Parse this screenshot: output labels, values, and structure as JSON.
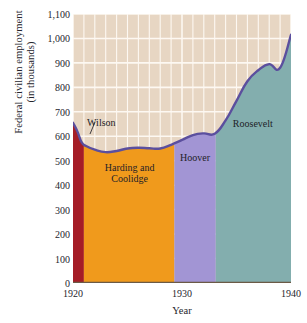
{
  "chart_data": {
    "type": "area",
    "title": "",
    "xlabel": "Year",
    "ylabel_line1": "Federal civilian employment",
    "ylabel_line2": "(in thousands)",
    "xlim": [
      1920,
      1940
    ],
    "ylim": [
      0,
      1100
    ],
    "xticks": [
      1920,
      1930,
      1940
    ],
    "xtick_labels": [
      "1920",
      "1930",
      "1940"
    ],
    "yticks": [
      0,
      100,
      200,
      300,
      400,
      500,
      600,
      700,
      800,
      900,
      1000,
      1100
    ],
    "ytick_labels": [
      "0",
      "100",
      "200",
      "300",
      "400",
      "500",
      "600",
      "700",
      "800",
      "900",
      "1,000",
      "1,100"
    ],
    "grid": true,
    "legend": "none",
    "x": [
      1920.0,
      1920.4,
      1920.8,
      1921.2,
      1922.0,
      1923.0,
      1924.0,
      1925.0,
      1926.0,
      1927.0,
      1928.0,
      1929.0,
      1930.0,
      1931.0,
      1932.0,
      1933.0,
      1934.0,
      1935.0,
      1936.0,
      1937.0,
      1938.0,
      1939.0,
      1940.0
    ],
    "values": [
      655,
      620,
      575,
      560,
      545,
      535,
      540,
      550,
      553,
      551,
      550,
      565,
      585,
      605,
      612,
      610,
      665,
      745,
      825,
      870,
      895,
      880,
      1015
    ],
    "series": [
      {
        "name": "Federal civilian employment",
        "values": [
          655,
          620,
          575,
          560,
          545,
          535,
          540,
          550,
          553,
          551,
          550,
          565,
          585,
          605,
          612,
          610,
          665,
          745,
          825,
          870,
          895,
          880,
          1015
        ]
      }
    ],
    "line_color": "#5b4f9e",
    "plot_background": "#e7d6c3",
    "gridline_color": "#fdf8f2",
    "annotations": [
      {
        "label": "Wilson",
        "x_start": 1920.0,
        "x_end": 1921.0,
        "color": "#a51d26",
        "label_position": "outside-upper-right"
      },
      {
        "label": "Harding and Coolidge",
        "x_start": 1921.0,
        "x_end": 1929.3,
        "color": "#f09a1c",
        "label_position": "inside"
      },
      {
        "label": "Hoover",
        "x_start": 1929.3,
        "x_end": 1933.1,
        "color": "#a295d4",
        "label_position": "inside-upper"
      },
      {
        "label": "Roosevelt",
        "x_start": 1933.1,
        "x_end": 1940.0,
        "color": "#83aeae",
        "label_position": "inside-upper"
      }
    ]
  },
  "bands": [
    {
      "label": "Wilson",
      "label_html": "Wilson",
      "color": "#a51d26"
    },
    {
      "label_line1": "Harding and",
      "label_line2": "Coolidge",
      "color": "#f09a1c"
    },
    {
      "label": "Hoover",
      "color": "#a295d4"
    },
    {
      "label": "Roosevelt",
      "color": "#83aeae"
    }
  ],
  "axis": {
    "ylabel_line1": "Federal civilian employment",
    "ylabel_line2": "(in thousands)",
    "xlabel": "Year",
    "ytick_labels": [
      "1,100",
      "1,000",
      "900",
      "800",
      "700",
      "600",
      "500",
      "400",
      "300",
      "200",
      "100",
      "0"
    ],
    "xtick_labels": [
      "1920",
      "1930",
      "1940"
    ]
  }
}
